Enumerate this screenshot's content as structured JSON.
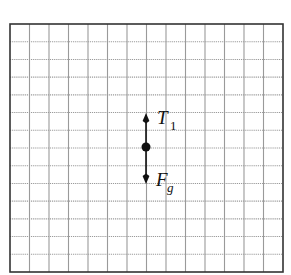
{
  "diagram": {
    "type": "free-body-diagram",
    "grid": {
      "columns": 14,
      "rows": 14,
      "left": 10,
      "top": 24,
      "right": 283,
      "bottom": 272,
      "line_color": "#9a9a9a",
      "border_color": "#333333"
    },
    "object": {
      "shape": "point",
      "cx": 146,
      "cy": 147,
      "r": 4.5,
      "color": "#111111"
    },
    "forces": [
      {
        "name": "tension",
        "symbol": "T",
        "subscript": "1",
        "direction": "up",
        "length_squares": 2,
        "x1": 146,
        "y1": 147,
        "x2": 146,
        "y2": 113,
        "label_x": 157,
        "label_y": 124,
        "sub_dx": 13,
        "sub_dy": 6
      },
      {
        "name": "gravity",
        "symbol": "F",
        "subscript": "g",
        "direction": "down",
        "length_squares": 2,
        "x1": 146,
        "y1": 147,
        "x2": 146,
        "y2": 184,
        "label_x": 156,
        "label_y": 186,
        "sub_dx": 11,
        "sub_dy": 6
      }
    ]
  }
}
